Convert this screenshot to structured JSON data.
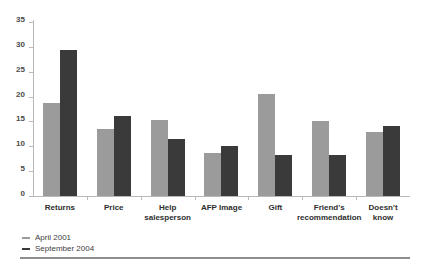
{
  "chart_data": {
    "type": "bar",
    "title": "",
    "subtitle": "",
    "xlabel": "",
    "ylabel": "",
    "ylim": [
      0,
      35
    ],
    "ytick_step": 5,
    "yticks": [
      0,
      5,
      10,
      15,
      20,
      25,
      30,
      35
    ],
    "grid": false,
    "legend_position": "bottom-left",
    "categories": [
      "Returns",
      "Price",
      "Help\nsalesperson",
      "AFP Image",
      "Gift",
      "Friend's\nrecommendation",
      "Doesn't\nknow"
    ],
    "series": [
      {
        "name": "April 2001",
        "color": "#9b9b9b",
        "values": [
          18.8,
          13.5,
          15.2,
          8.7,
          20.5,
          15.0,
          12.8
        ]
      },
      {
        "name": "September 2004",
        "color": "#3a3a3a",
        "values": [
          29.3,
          16.0,
          11.5,
          10.0,
          8.3,
          8.3,
          14.0
        ]
      }
    ]
  },
  "legend": {
    "items": [
      {
        "label": "April 2001",
        "color": "#9b9b9b"
      },
      {
        "label": "September 2004",
        "color": "#3a3a3a"
      }
    ]
  },
  "colors": {
    "series_april_2001": "#9b9b9b",
    "series_september_2004": "#3a3a3a",
    "axis": "#b9b9b9",
    "tick_label": "#4b4b4b",
    "category_label": "#2e2e2e",
    "rule": "#8d8d8d",
    "background": "#ffffff"
  }
}
